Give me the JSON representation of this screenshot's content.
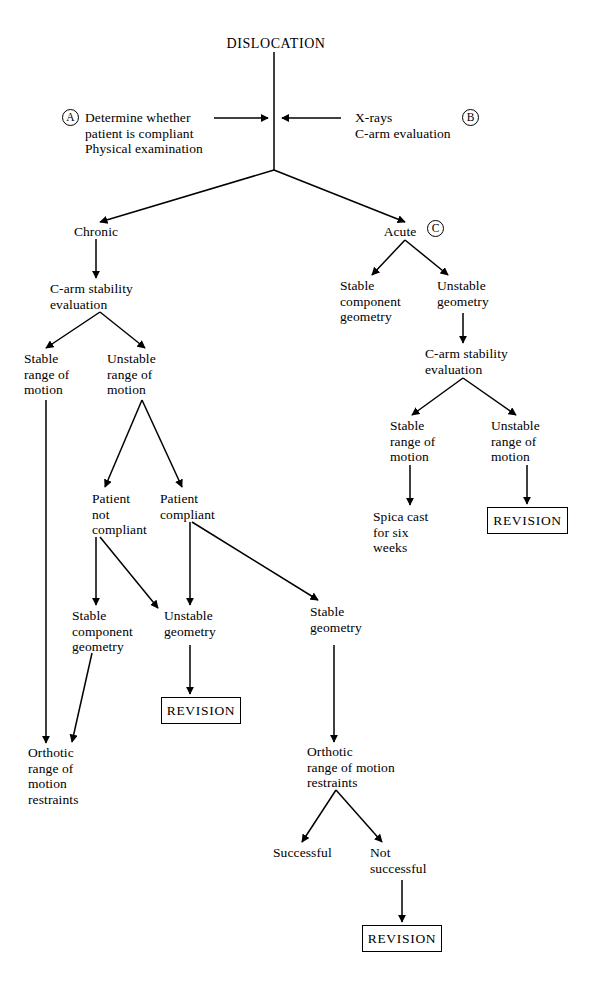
{
  "diagram": {
    "title": "DISLOCATION",
    "type": "clinical-decision-flowchart",
    "markers": [
      {
        "id": "A",
        "label": "A"
      },
      {
        "id": "B",
        "label": "B"
      },
      {
        "id": "C",
        "label": "C"
      }
    ],
    "nodes": {
      "root": "DISLOCATION",
      "input_left": "Determine whether\npatient is compliant\nPhysical examination",
      "input_right": "X-rays\nC-arm evaluation",
      "chronic": "Chronic",
      "acute": "Acute",
      "chronic_carm": "C-arm stability\nevaluation",
      "chronic_stable_rom": "Stable\nrange of\nmotion",
      "chronic_unstable_rom": "Unstable\nrange of\nmotion",
      "patient_not_compliant": "Patient\nnot\ncompliant",
      "patient_compliant": "Patient\ncompliant",
      "chronic_stable_component_geometry": "Stable\ncomponent\ngeometry",
      "chronic_unstable_geometry": "Unstable\ngeometry",
      "chronic_stable_geometry": "Stable\ngeometry",
      "orthotic_left": "Orthotic\nrange of\nmotion\nrestraints",
      "orthotic_center": "Orthotic\nrange of motion\nrestraints",
      "successful": "Successful",
      "not_successful": "Not\nsuccessful",
      "acute_stable_component_geometry": "Stable\ncomponent\ngeometry",
      "acute_unstable_geometry": "Unstable\ngeometry",
      "acute_carm": "C-arm stability\nevaluation",
      "acute_stable_rom": "Stable\nrange of\nmotion",
      "acute_unstable_rom": "Unstable\nrange of\nmotion",
      "spica_cast": "Spica cast\nfor six\nweeks",
      "revision_left": "REVISION",
      "revision_right": "REVISION",
      "revision_bottom": "REVISION"
    },
    "colors": {
      "background": "#ffffff",
      "line": "#000000",
      "text": "#000000"
    }
  }
}
